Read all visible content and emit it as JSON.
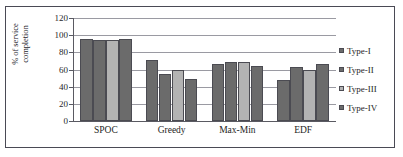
{
  "chart_data": {
    "type": "bar",
    "title": "",
    "xlabel": "",
    "ylabel": "% of service completion",
    "ylabel_line1": "% of service",
    "ylabel_line2": "completion",
    "categories": [
      "SPOC",
      "Greedy",
      "Max-Min",
      "EDF"
    ],
    "yticks": [
      0,
      20,
      40,
      60,
      80,
      100,
      120
    ],
    "ylim": [
      0,
      120
    ],
    "grid": true,
    "legend_position": "right",
    "series": [
      {
        "name": "Type-I",
        "color": "#6b6b6b",
        "values": [
          96,
          71,
          66,
          48
        ]
      },
      {
        "name": "Type-II",
        "color": "#6b6b6b",
        "values": [
          94,
          55,
          69,
          63
        ]
      },
      {
        "name": "Type-III",
        "color": "#b3b3b3",
        "values": [
          94,
          59,
          69,
          59
        ]
      },
      {
        "name": "Type-IV",
        "color": "#6b6b6b",
        "values": [
          96,
          49,
          64,
          67
        ]
      }
    ]
  },
  "colors": {
    "frame_border": "#4a4a55",
    "axis": "#5a5a62",
    "gridline": "#9a9aa2",
    "bar_dark": "#6b6b6b",
    "bar_light": "#b3b3b3",
    "bar_outline": "#4b4b52",
    "text": "#1e1e24",
    "background": "#ffffff"
  }
}
